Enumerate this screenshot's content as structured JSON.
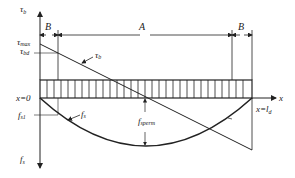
{
  "diagram": {
    "axes": {
      "vertical_top_label": "τ",
      "vertical_top_sub": "b",
      "vertical_bottom_label": "f",
      "vertical_bottom_sub": "s",
      "horizontal_label": "x"
    },
    "dimensions": {
      "left_segment": "B",
      "middle_segment": "A",
      "right_segment": "B"
    },
    "labels": {
      "tau_max": "τ",
      "tau_max_sub": "max",
      "tau_bd": "τ",
      "tau_bd_sub": "bd",
      "tau_b_curve": "τ",
      "tau_b_curve_sub": "b",
      "x_start": "x=0",
      "x_end_prefix": "x=l",
      "x_end_sub": "d",
      "f_s1": "f",
      "f_s1_sub": "s1",
      "f_s_curve": "f",
      "f_s_curve_sub": "s",
      "f_sperm": "f",
      "f_sperm_sub": "sperm",
      "minus_sign": "−"
    },
    "colors": {
      "line": "#222222",
      "background": "#ffffff"
    }
  }
}
